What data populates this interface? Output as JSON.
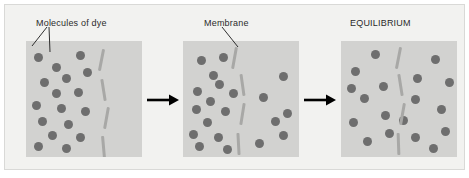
{
  "figure": {
    "background_color": "#f2f2f0",
    "panel_color": "#d2d2d0",
    "molecule_color": "#6e6e6e",
    "membrane_color": "#a8a8a6",
    "arrow_color": "#000000",
    "text_color": "#2b2b2b"
  },
  "labels": {
    "molecules_of_dye": "Molecules of dye",
    "membrane": "Membrane",
    "equilibrium": "EQUILIBRIUM"
  },
  "icons": {
    "arrow_1": "arrow-right-icon",
    "arrow_2": "arrow-right-icon",
    "leader_lines": "leader-line-icon"
  },
  "chart_data": {
    "type": "diagram",
    "stages": [
      {
        "name": "Start",
        "label": "Molecules of dye",
        "left_count": 17,
        "right_count": 0,
        "total": 17,
        "description": "All dye molecules are on the left side of the membrane"
      },
      {
        "name": "Diffusing",
        "label": "Membrane",
        "left_count": 14,
        "right_count": 6,
        "total": 20,
        "description": "Dye molecules begin crossing the membrane to the right side"
      },
      {
        "name": "Equilibrium",
        "label": "EQUILIBRIUM",
        "left_count": 9,
        "right_count": 9,
        "total": 18,
        "description": "Dye molecules are evenly distributed on both sides"
      }
    ],
    "panels": [
      {
        "id": "panel-1",
        "molecules": [
          {
            "x": 8,
            "y": 12
          },
          {
            "x": 26,
            "y": 22
          },
          {
            "x": 50,
            "y": 10
          },
          {
            "x": 36,
            "y": 33
          },
          {
            "x": 14,
            "y": 37
          },
          {
            "x": 57,
            "y": 27
          },
          {
            "x": 26,
            "y": 48
          },
          {
            "x": 48,
            "y": 47
          },
          {
            "x": 6,
            "y": 60
          },
          {
            "x": 31,
            "y": 63
          },
          {
            "x": 55,
            "y": 66
          },
          {
            "x": 12,
            "y": 76
          },
          {
            "x": 38,
            "y": 79
          },
          {
            "x": 22,
            "y": 90
          },
          {
            "x": 50,
            "y": 92
          },
          {
            "x": 8,
            "y": 101
          },
          {
            "x": 36,
            "y": 103
          }
        ],
        "membrane_dashes": [
          {
            "x": 74,
            "y": 8,
            "len": 22,
            "rot": 11
          },
          {
            "x": 76,
            "y": 38,
            "len": 22,
            "rot": -9
          },
          {
            "x": 79,
            "y": 66,
            "len": 22,
            "rot": 10
          },
          {
            "x": 76,
            "y": 95,
            "len": 22,
            "rot": -5
          }
        ]
      },
      {
        "id": "panel-2",
        "molecules": [
          {
            "x": 14,
            "y": 15
          },
          {
            "x": 36,
            "y": 12
          },
          {
            "x": 32,
            "y": 39
          },
          {
            "x": 10,
            "y": 46
          },
          {
            "x": 46,
            "y": 48
          },
          {
            "x": 23,
            "y": 56
          },
          {
            "x": 9,
            "y": 64
          },
          {
            "x": 38,
            "y": 66
          },
          {
            "x": 20,
            "y": 77
          },
          {
            "x": 6,
            "y": 89
          },
          {
            "x": 31,
            "y": 92
          },
          {
            "x": 12,
            "y": 101
          },
          {
            "x": 40,
            "y": 104
          },
          {
            "x": 26,
            "y": 30
          },
          {
            "x": 96,
            "y": 31
          },
          {
            "x": 76,
            "y": 52
          },
          {
            "x": 100,
            "y": 68
          },
          {
            "x": 88,
            "y": 76
          },
          {
            "x": 96,
            "y": 90
          },
          {
            "x": 72,
            "y": 98
          }
        ],
        "membrane_dashes": [
          {
            "x": 50,
            "y": 6,
            "len": 22,
            "rot": 10
          },
          {
            "x": 58,
            "y": 33,
            "len": 22,
            "rot": -8
          },
          {
            "x": 58,
            "y": 62,
            "len": 22,
            "rot": 9
          },
          {
            "x": 54,
            "y": 92,
            "len": 22,
            "rot": -3
          }
        ]
      },
      {
        "id": "panel-3",
        "molecules": [
          {
            "x": 30,
            "y": 9
          },
          {
            "x": 10,
            "y": 26
          },
          {
            "x": 6,
            "y": 43
          },
          {
            "x": 38,
            "y": 41
          },
          {
            "x": 19,
            "y": 53
          },
          {
            "x": 8,
            "y": 77
          },
          {
            "x": 40,
            "y": 70
          },
          {
            "x": 22,
            "y": 96
          },
          {
            "x": 44,
            "y": 88
          },
          {
            "x": 90,
            "y": 14
          },
          {
            "x": 72,
            "y": 33
          },
          {
            "x": 104,
            "y": 37
          },
          {
            "x": 70,
            "y": 54
          },
          {
            "x": 96,
            "y": 64
          },
          {
            "x": 100,
            "y": 86
          },
          {
            "x": 70,
            "y": 92
          },
          {
            "x": 88,
            "y": 103
          },
          {
            "x": 58,
            "y": 75
          }
        ],
        "membrane_dashes": [
          {
            "x": 56,
            "y": 6,
            "len": 22,
            "rot": 11
          },
          {
            "x": 58,
            "y": 33,
            "len": 22,
            "rot": -9
          },
          {
            "x": 60,
            "y": 62,
            "len": 22,
            "rot": 10
          },
          {
            "x": 56,
            "y": 92,
            "len": 22,
            "rot": -2
          }
        ]
      }
    ]
  }
}
